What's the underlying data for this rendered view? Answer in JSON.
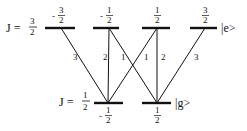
{
  "diagram": {
    "type": "energy-level-transition-diagram",
    "colors": {
      "line": "#111111",
      "level": "#111111",
      "background": "#ffffff"
    },
    "upper": {
      "label_prefix": "J =",
      "label_num": "3",
      "label_den": "2",
      "state": "|e>",
      "y": 28,
      "levels": [
        {
          "m_sign": "-",
          "m_num": "3",
          "m_den": "2",
          "x1": 45,
          "x2": 75,
          "cx": 61
        },
        {
          "m_sign": "-",
          "m_num": "1",
          "m_den": "2",
          "x1": 93,
          "x2": 119,
          "cx": 109
        },
        {
          "m_sign": "",
          "m_num": "1",
          "m_den": "2",
          "x1": 142,
          "x2": 170,
          "cx": 157
        },
        {
          "m_sign": "",
          "m_num": "3",
          "m_den": "2",
          "x1": 190,
          "x2": 217,
          "cx": 205
        }
      ]
    },
    "lower": {
      "label_prefix": "J =",
      "label_num": "1",
      "label_den": "2",
      "state": "|g>",
      "y": 103,
      "levels": [
        {
          "m_sign": "-",
          "m_num": "1",
          "m_den": "2",
          "x1": 94,
          "x2": 123,
          "cx": 108
        },
        {
          "m_sign": "",
          "m_num": "1",
          "m_den": "2",
          "x1": 142,
          "x2": 171,
          "cx": 157
        }
      ]
    },
    "transitions": [
      {
        "from_upper": 0,
        "to_lower": 0,
        "strength": "3",
        "label_x": 73,
        "label_y": 60
      },
      {
        "from_upper": 1,
        "to_lower": 0,
        "strength": "2",
        "label_x": 103,
        "label_y": 60
      },
      {
        "from_upper": 1,
        "to_lower": 1,
        "strength": "1",
        "label_x": 121,
        "label_y": 60
      },
      {
        "from_upper": 2,
        "to_lower": 0,
        "strength": "1",
        "label_x": 144,
        "label_y": 60
      },
      {
        "from_upper": 2,
        "to_lower": 1,
        "strength": "2",
        "label_x": 161,
        "label_y": 60
      },
      {
        "from_upper": 3,
        "to_lower": 1,
        "strength": "3",
        "label_x": 194,
        "label_y": 60
      }
    ]
  }
}
